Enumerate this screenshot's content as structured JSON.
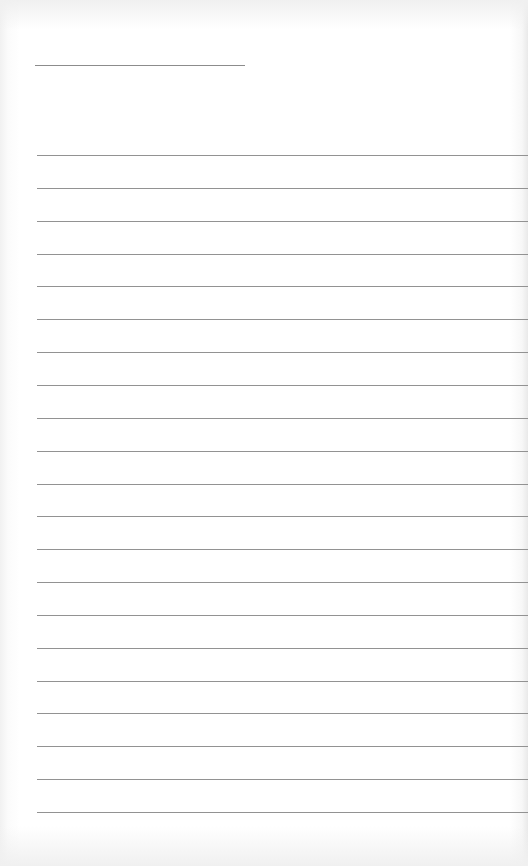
{
  "page": {
    "type": "lined-notepaper",
    "background_color": "#ffffff",
    "line_color": "#929292"
  },
  "title_line": {
    "x": 35,
    "y": 65,
    "width": 210
  },
  "ruled_lines": {
    "count": 21,
    "first_y": 155,
    "spacing": 32.85,
    "left": 37
  }
}
